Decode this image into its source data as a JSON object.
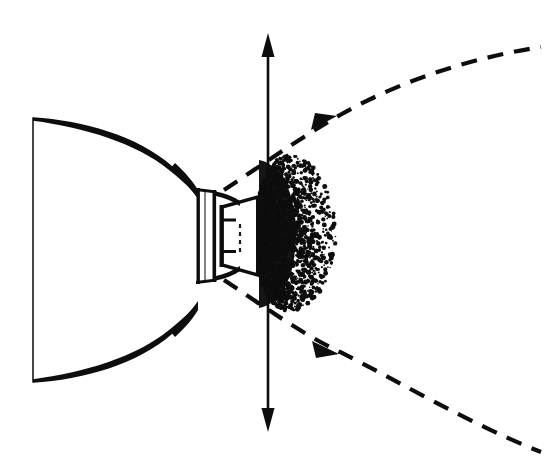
{
  "figure": {
    "background_color": "#ffffff",
    "ink_color": "#0d0d0d",
    "canvas": {
      "width": 545,
      "height": 465
    }
  },
  "parts": {
    "bell": {
      "name": "flared-bell-body",
      "left_edge_x": 33,
      "top_left_y": 118,
      "bottom_left_y": 382,
      "throat_x": 196,
      "throat_top_y": 188,
      "throat_bottom_y": 282,
      "stroke_color": "#0d0d0d"
    },
    "collar": {
      "name": "throat-collar-ring",
      "x": 198,
      "y": 186,
      "width": 18,
      "height": 98
    },
    "nozzle": {
      "name": "nozzle-cone",
      "throat_x": 221,
      "exit_x": 258,
      "exit_top_y": 196,
      "exit_bottom_y": 276
    },
    "inner_mark": {
      "name": "nozzle-inner-dashed-mark",
      "x": 240,
      "y_top": 224,
      "y_bottom": 252
    },
    "plume": {
      "name": "exhaust-plume-stipple",
      "center_x": 288,
      "center_y": 233,
      "radius_x": 33,
      "radius_y": 78,
      "dot_count": 2600,
      "fill_color": "#0d0d0d"
    },
    "axis_arrow": {
      "name": "vertical-axis-double-arrow",
      "x": 268,
      "top_y": 33,
      "bottom_y": 432,
      "head_length": 22,
      "head_width": 13,
      "stroke_color": "#2a2a2a"
    },
    "upper_boundary": {
      "name": "upper-dashed-boundary-curve",
      "start": [
        225,
        190
      ],
      "arrow_at": [
        330,
        120
      ],
      "end": [
        541,
        48
      ],
      "dash_pattern": "16 11"
    },
    "lower_boundary": {
      "name": "lower-dashed-boundary-curve",
      "start": [
        225,
        280
      ],
      "arrow_at": [
        330,
        352
      ],
      "end": [
        541,
        452
      ],
      "dash_pattern": "16 11"
    }
  },
  "labels": {
    "items": []
  }
}
